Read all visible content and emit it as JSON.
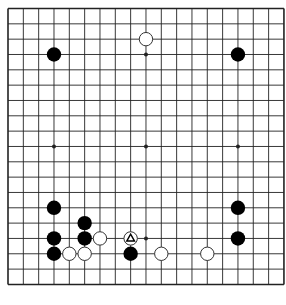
{
  "board": {
    "size": 19,
    "origin_x": 8,
    "origin_y": 8.5,
    "spacing": 15.33,
    "line_color": "#222222",
    "background": "#ffffff",
    "hoshi": [
      [
        3,
        3
      ],
      [
        9,
        3
      ],
      [
        15,
        3
      ],
      [
        3,
        9
      ],
      [
        9,
        9
      ],
      [
        15,
        9
      ],
      [
        3,
        15
      ],
      [
        9,
        15
      ],
      [
        15,
        15
      ]
    ]
  },
  "stones": [
    {
      "color": "black",
      "col": 3,
      "row": 3
    },
    {
      "color": "white",
      "col": 9,
      "row": 2
    },
    {
      "color": "black",
      "col": 15,
      "row": 3
    },
    {
      "color": "black",
      "col": 3,
      "row": 13
    },
    {
      "color": "black",
      "col": 5,
      "row": 14
    },
    {
      "color": "black",
      "col": 3,
      "row": 15
    },
    {
      "color": "black",
      "col": 5,
      "row": 15
    },
    {
      "color": "white",
      "col": 6,
      "row": 15
    },
    {
      "color": "white",
      "col": 8,
      "row": 15,
      "marker": "triangle"
    },
    {
      "color": "black",
      "col": 3,
      "row": 16
    },
    {
      "color": "white",
      "col": 4,
      "row": 16
    },
    {
      "color": "white",
      "col": 5,
      "row": 16
    },
    {
      "color": "black",
      "col": 8,
      "row": 16
    },
    {
      "color": "white",
      "col": 10,
      "row": 16
    },
    {
      "color": "white",
      "col": 13,
      "row": 16
    },
    {
      "color": "black",
      "col": 15,
      "row": 13
    },
    {
      "color": "black",
      "col": 15,
      "row": 15
    }
  ],
  "colors": {
    "black_stone": "#000000",
    "white_stone_fill": "#ffffff",
    "white_stone_stroke": "#333333",
    "marker": "#000000"
  }
}
